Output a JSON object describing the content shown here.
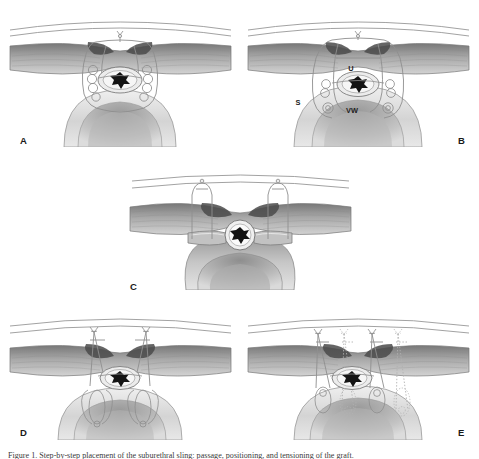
{
  "figure": {
    "type": "medical-illustration",
    "panel_count": 5,
    "background_color": "#ffffff",
    "line_color": "#6e6e6e",
    "muscle_color_dark": "#5e5e5e",
    "muscle_color_light": "#c9c9c9",
    "tissue_color": "#d8d8d8",
    "lumen_color": "#141414"
  },
  "panels": [
    {
      "id": "A",
      "letter": "A",
      "description": "Suture passed around urethra with helical coils, sling not yet tensioned",
      "labels": []
    },
    {
      "id": "B",
      "letter": "B",
      "description": "Sling in place around urethra, anatomical structures labeled",
      "labels": [
        {
          "text": "U",
          "meaning": "urethra",
          "x": 351,
          "y": 68
        },
        {
          "text": "S",
          "meaning": "sling",
          "x": 298,
          "y": 102
        },
        {
          "text": "VW",
          "meaning": "vaginal wall",
          "x": 352,
          "y": 110
        }
      ]
    },
    {
      "id": "C",
      "letter": "C",
      "description": "Sagittal-oblique view with two parallel sling arms passing upward",
      "labels": []
    },
    {
      "id": "D",
      "letter": "D",
      "description": "Sutures tied above the rectus fascia, sling tensioned",
      "labels": []
    },
    {
      "id": "E",
      "letter": "E",
      "description": "Completed repair with additional contralateral sutures shown in dotted outline",
      "labels": []
    }
  ],
  "caption": {
    "prefix": "Figure 1.",
    "text": "Figure 1. Step-by-step placement of the suburethral sling: passage, positioning, and tensioning of the graft."
  }
}
